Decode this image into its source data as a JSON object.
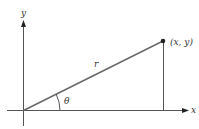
{
  "diagram": {
    "type": "polar-coordinates",
    "labels": {
      "x_axis": "x",
      "y_axis": "y",
      "point": "(x, y)",
      "radius": "r",
      "angle": "θ"
    },
    "colors": {
      "axis": "#555555",
      "radius_line": "#6a6a6a",
      "point": "#222222",
      "text": "#333333"
    },
    "geometry": {
      "origin": [
        23,
        110
      ],
      "point": [
        163,
        41
      ],
      "x_axis_range": [
        7,
        188
      ],
      "y_axis_range": [
        22,
        126
      ],
      "angle_arc_radius": 37
    }
  }
}
